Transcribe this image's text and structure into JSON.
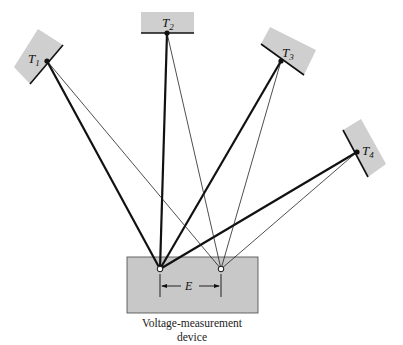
{
  "colors": {
    "plate_fill": "#cfcfcf",
    "box_fill": "#c8c8c8",
    "line": "#111111",
    "background": "#ffffff"
  },
  "thermocouples": [
    {
      "id": "T1",
      "label": "T",
      "sub": "1"
    },
    {
      "id": "T2",
      "label": "T",
      "sub": "2"
    },
    {
      "id": "T3",
      "label": "T",
      "sub": "3"
    },
    {
      "id": "T4",
      "label": "T",
      "sub": "4"
    }
  ],
  "device": {
    "caption_line1": "Voltage-measurement",
    "caption_line2": "device",
    "emf_label": "E"
  }
}
